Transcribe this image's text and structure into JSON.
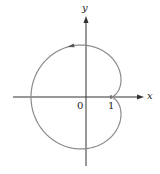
{
  "figure": {
    "axes": {
      "x_label": "x",
      "y_label": "y",
      "origin_label": "0",
      "tick_label": "1"
    },
    "curve": {
      "type": "cardioid",
      "cusp": [
        1,
        0
      ],
      "a": 1.6,
      "direction": "counterclockwise",
      "color": "#8a8a8a"
    },
    "colors": {
      "axis": "#333333",
      "curve": "#8a8a8a",
      "arrow": "#555555"
    }
  }
}
